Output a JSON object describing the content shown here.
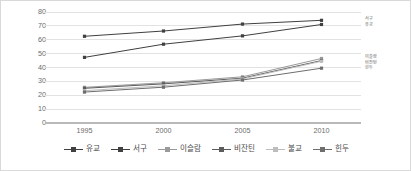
{
  "chart_data": {
    "type": "line",
    "title": "",
    "subtitle": "",
    "xlabel": "",
    "ylabel": "",
    "x": [
      1995,
      2000,
      2005,
      2010
    ],
    "xtick_labels": [
      "1995",
      "2000",
      "2005",
      "2010"
    ],
    "ytick_labels": [
      "0",
      "10",
      "20",
      "30",
      "40",
      "50",
      "60",
      "70",
      "80"
    ],
    "ytick_values": [
      0,
      10,
      20,
      30,
      40,
      50,
      60,
      70,
      80
    ],
    "ylim": [
      0,
      80
    ],
    "grid": "horizontal",
    "legend_position": "bottom",
    "series": [
      {
        "name": "유교",
        "marker": "square",
        "color": "#404040",
        "values": [
          62.5,
          66.3,
          71.3,
          74.0
        ]
      },
      {
        "name": "서구",
        "marker": "square",
        "color": "#404040",
        "values": [
          47.3,
          56.8,
          62.8,
          71.0
        ]
      },
      {
        "name": "이슬람",
        "marker": "square",
        "color": "#9a9a9a",
        "values": [
          25.7,
          29.0,
          33.3,
          46.5
        ]
      },
      {
        "name": "비잔틴",
        "marker": "square",
        "color": "#5c5c5c",
        "values": [
          25.0,
          28.2,
          32.3,
          45.0
        ]
      },
      {
        "name": "불교",
        "marker": "square",
        "color": "#bdbdbd",
        "values": [
          23.3,
          26.8,
          31.8,
          44.5
        ]
      },
      {
        "name": "힌두",
        "marker": "square",
        "color": "#6e6e6e",
        "values": [
          22.3,
          25.8,
          31.0,
          39.5
        ]
      }
    ],
    "edge_annotations": [
      {
        "text": "서구",
        "value": 74.0,
        "group": "top"
      },
      {
        "text": "유교",
        "value": 71.0,
        "group": "top"
      },
      {
        "text": "이슬람",
        "value": 46.5,
        "group": "lower"
      },
      {
        "text": "비잔틴",
        "value": 45.0,
        "group": "lower"
      },
      {
        "text": "힌두",
        "value": 39.5,
        "group": "lower"
      }
    ]
  },
  "legend": {
    "items": [
      {
        "label": "유교",
        "color": "#404040"
      },
      {
        "label": "서구",
        "color": "#404040"
      },
      {
        "label": "이슬람",
        "color": "#9a9a9a"
      },
      {
        "label": "비잔틴",
        "color": "#5c5c5c"
      },
      {
        "label": "불교",
        "color": "#bdbdbd"
      },
      {
        "label": "힌두",
        "color": "#6e6e6e"
      }
    ]
  },
  "style": {
    "grid_color": "#e2e2e2",
    "axis_color": "#b9b9b9",
    "tick_text_color": "#6b6b6b",
    "border_color": "#d9d9d9",
    "background": "#ffffff"
  }
}
